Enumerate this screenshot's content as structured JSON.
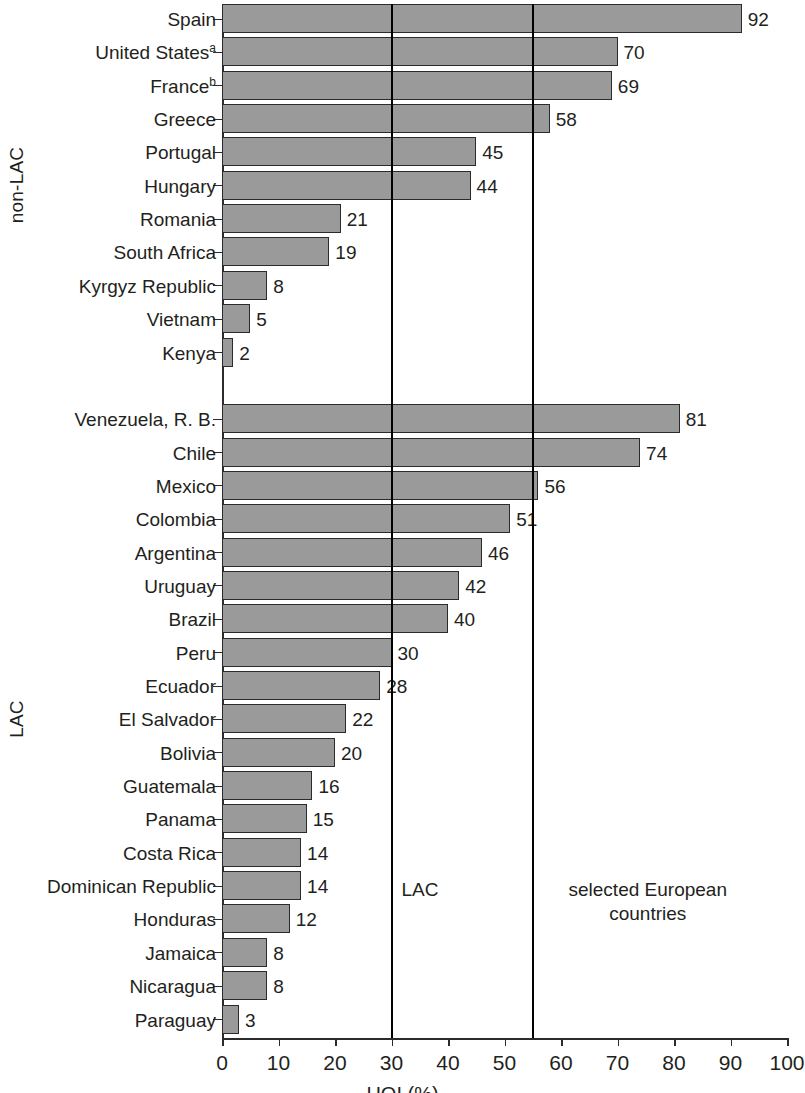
{
  "chart_data": {
    "type": "bar",
    "orientation": "horizontal",
    "title": "",
    "xlabel": "HOI (%)",
    "ylabel": "",
    "xlim": [
      0,
      100
    ],
    "xticks": [
      0,
      10,
      20,
      30,
      40,
      50,
      60,
      70,
      80,
      90,
      100
    ],
    "grid": false,
    "legend": null,
    "groups": [
      {
        "name": "non-LAC",
        "categories": [
          "Spain",
          "United States",
          "France",
          "Greece",
          "Portugal",
          "Hungary",
          "Romania",
          "South Africa",
          "Kyrgyz Republic",
          "Vietnam",
          "Kenya"
        ],
        "category_footnotes": [
          "",
          "a",
          "b",
          "",
          "",
          "",
          "",
          "",
          "",
          "",
          ""
        ],
        "values": [
          92,
          70,
          69,
          58,
          45,
          44,
          21,
          19,
          8,
          5,
          2
        ]
      },
      {
        "name": "LAC",
        "categories": [
          "Venezuela, R. B.",
          "Chile",
          "Mexico",
          "Colombia",
          "Argentina",
          "Uruguay",
          "Brazil",
          "Peru",
          "Ecuador",
          "El Salvador",
          "Bolivia",
          "Guatemala",
          "Panama",
          "Costa Rica",
          "Dominican Republic",
          "Honduras",
          "Jamaica",
          "Nicaragua",
          "Paraguay"
        ],
        "category_footnotes": [
          "",
          "",
          "",
          "",
          "",
          "",
          "",
          "",
          "",
          "",
          "",
          "",
          "",
          "",
          "",
          "",
          "",
          "",
          ""
        ],
        "values": [
          81,
          74,
          56,
          51,
          46,
          42,
          40,
          30,
          28,
          22,
          20,
          16,
          15,
          14,
          14,
          12,
          8,
          8,
          3
        ]
      }
    ],
    "reference_lines": [
      {
        "value": 30,
        "label": "LAC",
        "label_align": "left"
      },
      {
        "value": 55,
        "label": "selected European countries",
        "label_align": "center"
      }
    ],
    "bar_fill_color": "#9a9a9a",
    "bar_border_color": "#2b2b2b",
    "axis_color": "#2b2b2b",
    "reference_line_color": "#000000"
  }
}
